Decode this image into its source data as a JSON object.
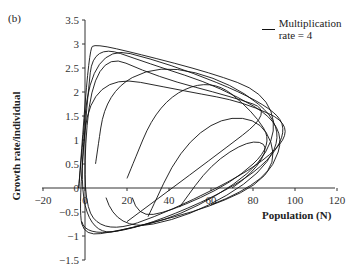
{
  "panel_label": "(b)",
  "legend": {
    "label": "Multiplication rate = 4"
  },
  "axes": {
    "xlabel": "Population (N)",
    "ylabel": "Growth rate/individual",
    "x_ticks": [
      "-20",
      "0",
      "20",
      "40",
      "60",
      "80",
      "100",
      "120"
    ],
    "y_ticks": [
      "3.5",
      "3",
      "2.5",
      "2",
      "1.5",
      "1",
      "0.5",
      "0",
      "-0.5",
      "-1",
      "-1.5"
    ]
  },
  "chart_data": {
    "type": "line",
    "title": "",
    "panel": "(b)",
    "xlabel": "Population (N)",
    "ylabel": "Growth rate/individual",
    "xlim": [
      -20,
      120
    ],
    "ylim": [
      -1.5,
      3.5
    ],
    "grid": false,
    "legend_position": "top-right",
    "series": [
      {
        "name": "Multiplication rate = 4",
        "description": "Chaotic phase-plane trajectory: growth rate per individual vs population, looping cycles",
        "x": [
          -3,
          2,
          5,
          25,
          60,
          85,
          92,
          80,
          45,
          15,
          0,
          -3,
          1,
          4,
          30,
          65,
          96,
          88,
          60,
          25,
          5,
          -3,
          3,
          50,
          75,
          100,
          85,
          40,
          10,
          -2,
          4,
          35,
          70,
          90,
          60,
          20
        ],
        "y": [
          0,
          2.9,
          3.0,
          2.8,
          2.4,
          2.0,
          1.2,
          0.3,
          -0.6,
          -0.9,
          -1.0,
          -0.5,
          1.8,
          3.0,
          2.6,
          2.1,
          1.3,
          0.2,
          -0.4,
          -0.8,
          -1.0,
          0,
          2.4,
          2.0,
          1.8,
          1.3,
          0.5,
          -0.5,
          -0.95,
          -0.3,
          2.9,
          2.3,
          1.9,
          1.6,
          0.6,
          -0.7
        ]
      }
    ]
  }
}
